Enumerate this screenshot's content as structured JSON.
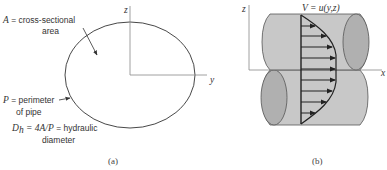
{
  "figure_a": {
    "caption": "(a)",
    "axis_labels": {
      "z": "z",
      "y": "y"
    },
    "area_label": {
      "symbol": "A",
      "text_line1": " = cross-sectional",
      "text_line2": "area"
    },
    "perimeter_label": {
      "symbol": "P",
      "text_line1": " = perimeter",
      "text_line2": "of pipe"
    },
    "hydraulic_label": {
      "symbol": "D",
      "subscript": "h",
      "formula": " = 4A/P",
      "text_line1": " = hydraulic",
      "text_line2": "diameter"
    }
  },
  "figure_b": {
    "caption": "(b)",
    "axis_labels": {
      "z": "z",
      "x": "x"
    },
    "velocity_label": "V = u(y,z)",
    "arrow_count": 9
  },
  "colors": {
    "line": "#333333",
    "axis": "#888888",
    "pipe_fill": "#c8c8c8",
    "pipe_end_fill": "#b0b0b0",
    "pipe_stroke": "#555555",
    "profile": "#222222"
  }
}
